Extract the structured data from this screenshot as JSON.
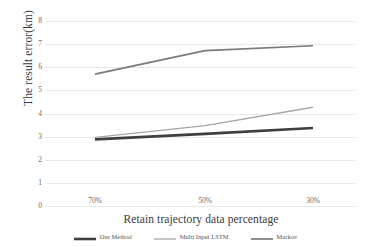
{
  "chart_data": {
    "type": "line",
    "title": "",
    "xlabel": "Retain trajectory data percentage",
    "ylabel": "The result error(km)",
    "categories": [
      "70%",
      "50%",
      "30%"
    ],
    "ylim": [
      0,
      8
    ],
    "yticks": [
      "0",
      "1",
      "2",
      "3",
      "4",
      "5",
      "6",
      "7",
      "8"
    ],
    "grid": true,
    "legend_position": "bottom",
    "series": [
      {
        "name": "Our Method",
        "color": "#3f3f3f",
        "width": 2.6,
        "values": [
          2.88,
          3.12,
          3.37
        ]
      },
      {
        "name": "Multi Input LSTM",
        "color": "#a6a6a6",
        "width": 1.3,
        "values": [
          2.97,
          3.48,
          4.27
        ]
      },
      {
        "name": "Markov",
        "color": "#7a7a7a",
        "width": 1.7,
        "values": [
          5.7,
          6.72,
          6.93
        ]
      }
    ]
  }
}
